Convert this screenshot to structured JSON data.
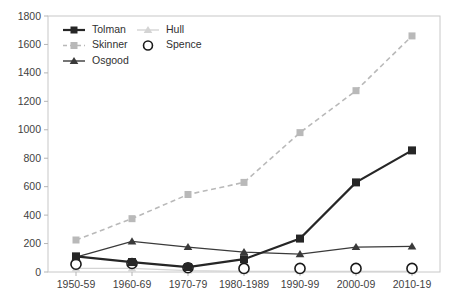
{
  "chart_data": {
    "type": "line",
    "title": "",
    "subtitle": "",
    "xlabel": "",
    "ylabel": "",
    "categories": [
      "1950-59",
      "1960-69",
      "1970-79",
      "1980-1989",
      "1990-99",
      "2000-09",
      "2010-19"
    ],
    "ylim": [
      0,
      1800
    ],
    "yticks": [
      0,
      200,
      400,
      600,
      800,
      1000,
      1200,
      1400,
      1600,
      1800
    ],
    "grid": false,
    "legend_position": "top-left-inside",
    "series": [
      {
        "name": "Tolman",
        "color": "#262626",
        "marker": "square",
        "linestyle": "solid",
        "values": [
          110,
          70,
          35,
          90,
          235,
          630,
          855
        ]
      },
      {
        "name": "Hull",
        "color": "#d4d4d4",
        "marker": "triangle",
        "linestyle": "solid",
        "values": [
          25,
          25,
          10,
          5,
          5,
          5,
          5
        ]
      },
      {
        "name": "Skinner",
        "color": "#b9b9b9",
        "marker": "square",
        "linestyle": "dashed",
        "values": [
          225,
          375,
          545,
          630,
          980,
          1275,
          1660
        ]
      },
      {
        "name": "Spence",
        "color": "#1a1a1a",
        "marker": "circle-open",
        "linestyle": "none",
        "values": [
          55,
          60,
          30,
          25,
          25,
          25,
          25
        ]
      },
      {
        "name": "Osgood",
        "color": "#3a3a3a",
        "marker": "triangle",
        "linestyle": "solid",
        "values": [
          105,
          215,
          175,
          140,
          125,
          175,
          180
        ]
      }
    ]
  },
  "legend": {
    "entries": [
      {
        "label": "Tolman"
      },
      {
        "label": "Hull"
      },
      {
        "label": "Skinner"
      },
      {
        "label": "Spence"
      },
      {
        "label": "Osgood"
      }
    ]
  },
  "axes": {
    "y_tick_labels": [
      "1800",
      "1600",
      "1400",
      "1200",
      "1000",
      "800",
      "600",
      "400",
      "200",
      "0"
    ],
    "x_tick_labels": [
      "1950-59",
      "1960-69",
      "1970-79",
      "1980-1989",
      "1990-99",
      "2000-09",
      "2010-19"
    ]
  },
  "colors": {
    "tolman": "#262626",
    "hull": "#d4d4d4",
    "skinner": "#b9b9b9",
    "spence": "#1a1a1a",
    "osgood": "#3a3a3a",
    "border": "#c8c8c8",
    "text": "#3f3f3f",
    "background": "#ffffff"
  }
}
